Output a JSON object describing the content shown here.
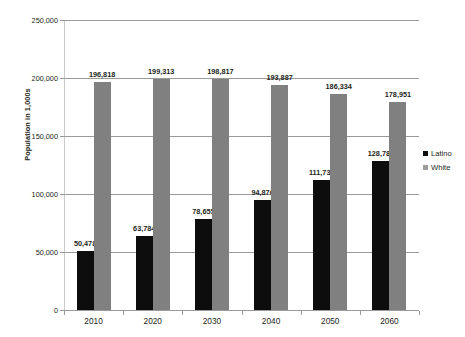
{
  "chart_data": {
    "type": "bar",
    "title": "",
    "subtitle": "",
    "xlabel": "",
    "ylabel": "Population in 1,000s",
    "categories": [
      "2010",
      "2020",
      "2030",
      "2040",
      "2050",
      "2060"
    ],
    "series": [
      {
        "name": "Latino",
        "color": "#0d0d0d",
        "values": [
          50478,
          63784,
          78655,
          94876,
          111732,
          128780
        ],
        "labels": [
          "50,478",
          "63,784",
          "78,655",
          "94,876",
          "111,732",
          "128,780"
        ]
      },
      {
        "name": "White",
        "color": "#808080",
        "values": [
          196818,
          199313,
          198817,
          193887,
          186334,
          178951
        ],
        "labels": [
          "196,818",
          "199,313",
          "198,817",
          "193,887",
          "186,334",
          "178,951"
        ]
      }
    ],
    "ylim": [
      0,
      250000
    ],
    "yticks": [
      0,
      50000,
      100000,
      150000,
      200000,
      250000
    ],
    "ytick_labels": [
      "0",
      "50,000",
      "100,000",
      "150,000",
      "200,000",
      "250,000"
    ],
    "grid": true,
    "legend_position": "right",
    "data_labels": true
  },
  "legend": {
    "items": [
      {
        "label": "Latino",
        "color": "#0d0d0d"
      },
      {
        "label": "White",
        "color": "#9c9c9c"
      }
    ]
  },
  "colors": {
    "latino": "#0d0d0d",
    "white": "#808080",
    "gridline": "#9a9a9a",
    "text": "#231f20",
    "background": "#ffffff"
  }
}
